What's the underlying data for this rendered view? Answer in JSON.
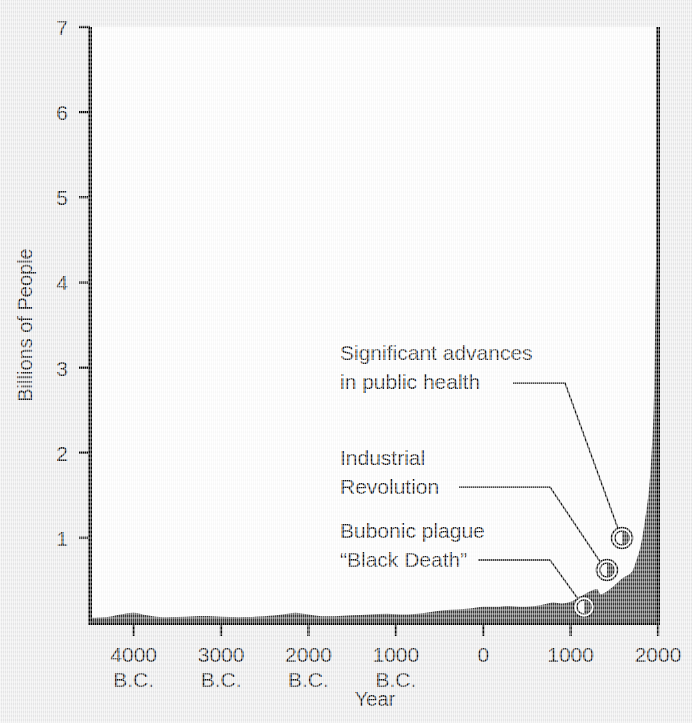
{
  "chart_data": {
    "type": "area",
    "title": "",
    "xlabel": "Year",
    "ylabel": "Billions of People",
    "xlim": [
      -4500,
      2000
    ],
    "ylim": [
      0,
      7
    ],
    "grid": false,
    "legend": "none",
    "y_ticks": [
      1,
      2,
      3,
      4,
      5,
      6,
      7
    ],
    "y_tick_labels": [
      "1",
      "2",
      "3",
      "4",
      "5",
      "6",
      "7"
    ],
    "x_ticks": [
      -4000,
      -3000,
      -2000,
      -1000,
      0,
      1000,
      2000
    ],
    "x_tick_labels": [
      "4000",
      "3000",
      "2000",
      "1000",
      "0",
      "1000",
      "2000"
    ],
    "x_tick_eras": [
      "B.C.",
      "B.C.",
      "B.C.",
      "B.C.",
      "",
      "",
      ""
    ],
    "series": [
      {
        "name": "World population",
        "x": [
          -4500,
          -4300,
          -4150,
          -4000,
          -3850,
          -3700,
          -3500,
          -3300,
          -3100,
          -2900,
          -2700,
          -2500,
          -2300,
          -2150,
          -2000,
          -1850,
          -1700,
          -1500,
          -1300,
          -1100,
          -900,
          -750,
          -600,
          -450,
          -300,
          -150,
          0,
          150,
          300,
          450,
          600,
          700,
          800,
          900,
          1000,
          1100,
          1200,
          1300,
          1340,
          1400,
          1500,
          1600,
          1700,
          1750,
          1800,
          1850,
          1900,
          1930,
          1950,
          1960,
          1970,
          1980,
          1990,
          2000
        ],
        "values": [
          0.06,
          0.07,
          0.1,
          0.12,
          0.09,
          0.07,
          0.07,
          0.08,
          0.08,
          0.07,
          0.07,
          0.08,
          0.1,
          0.12,
          0.1,
          0.08,
          0.08,
          0.09,
          0.1,
          0.11,
          0.1,
          0.11,
          0.13,
          0.15,
          0.16,
          0.17,
          0.19,
          0.19,
          0.2,
          0.19,
          0.2,
          0.22,
          0.24,
          0.23,
          0.25,
          0.3,
          0.36,
          0.4,
          0.34,
          0.36,
          0.44,
          0.53,
          0.6,
          0.73,
          0.9,
          1.2,
          1.6,
          2.07,
          2.5,
          3.0,
          3.7,
          4.45,
          5.3,
          7.0
        ]
      }
    ],
    "annotations": [
      {
        "id": "significant-advances",
        "lines": [
          "Significant advances",
          "in public health"
        ],
        "point_year": 1850,
        "point_value": 1.2
      },
      {
        "id": "industrial-revolution",
        "lines": [
          "Industrial",
          "Revolution"
        ],
        "point_year": 1750,
        "point_value": 0.73
      },
      {
        "id": "black-death",
        "lines": [
          "Bubonic plague",
          "“Black Death”"
        ],
        "point_year": 1340,
        "point_value": 0.34
      }
    ],
    "colors": {
      "area_fill": "#3a3a3a",
      "axis": "#000000",
      "text": "#111111",
      "plot_background": "#ffffff",
      "page_background": "#ececed"
    }
  }
}
